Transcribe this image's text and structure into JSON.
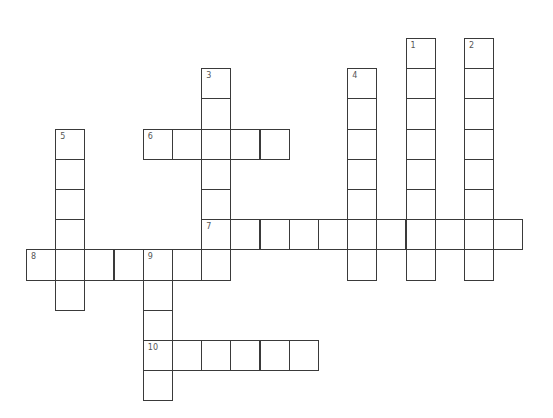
{
  "puzzle": {
    "type": "crossword",
    "words": [
      {
        "number": "1",
        "direction": "down",
        "row": 0,
        "col": 13,
        "length": 8
      },
      {
        "number": "2",
        "direction": "down",
        "row": 0,
        "col": 15,
        "length": 8
      },
      {
        "number": "3",
        "direction": "down",
        "row": 1,
        "col": 6,
        "length": 7
      },
      {
        "number": "4",
        "direction": "down",
        "row": 1,
        "col": 11,
        "length": 7
      },
      {
        "number": "5",
        "direction": "down",
        "row": 3,
        "col": 1,
        "length": 6
      },
      {
        "number": "6",
        "direction": "across",
        "row": 3,
        "col": 4,
        "length": 5
      },
      {
        "number": "7",
        "direction": "across",
        "row": 6,
        "col": 6,
        "length": 11
      },
      {
        "number": "8",
        "direction": "across",
        "row": 7,
        "col": 0,
        "length": 7
      },
      {
        "number": "9",
        "direction": "down",
        "row": 7,
        "col": 4,
        "length": 5
      },
      {
        "number": "10",
        "direction": "across",
        "row": 10,
        "col": 4,
        "length": 6
      }
    ]
  }
}
